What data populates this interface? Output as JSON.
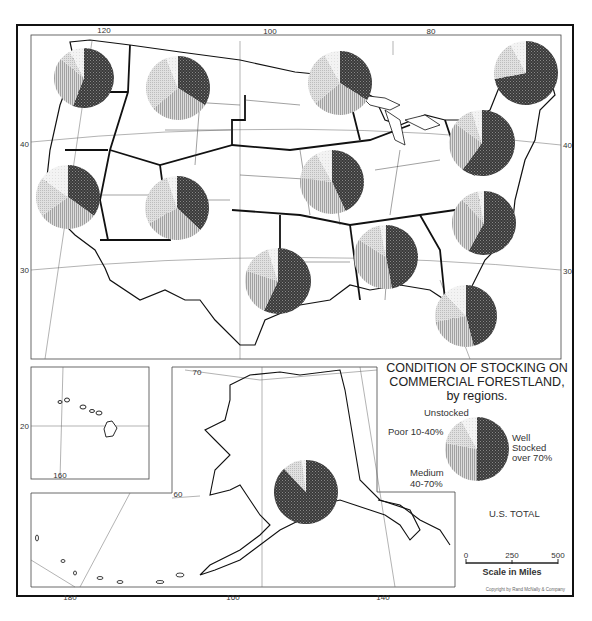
{
  "title": {
    "line1": "CONDITION OF STOCKING ON",
    "line2": "COMMERCIAL FORESTLAND,",
    "line3": "by regions."
  },
  "legend": {
    "unstocked": "Unstocked",
    "poor": "Poor 10-40%",
    "medium_line1": "Medium",
    "medium_line2": "40-70%",
    "well_line1": "Well",
    "well_line2": "Stocked",
    "well_line3": "over 70%",
    "total_label": "U.S. TOTAL"
  },
  "scale": {
    "label": "Scale in Miles",
    "ticks": [
      "0",
      "250",
      "500"
    ]
  },
  "copyright": "Copyright by Rand McNally & Company",
  "graticule": {
    "top_longitudes": [
      "120",
      "100",
      "80"
    ],
    "left_latitudes": [
      "40",
      "30"
    ],
    "right_latitudes": [
      "40",
      "30"
    ],
    "hawaii_lat": "20",
    "hawaii_lon": "160",
    "alaska_lat": [
      "70",
      "60"
    ],
    "bottom_longitudes": [
      "180",
      "160",
      "140"
    ]
  },
  "chart_data": {
    "type": "pie",
    "title": "Condition of Stocking on Commercial Forestland, by regions",
    "categories": [
      "Well Stocked over 70%",
      "Medium 40-70%",
      "Poor 10-40%",
      "Unstocked"
    ],
    "patterns": {
      "Well Stocked over 70%": "dark crosshatch",
      "Medium 40-70%": "vertical lines",
      "Poor 10-40%": "fine grid",
      "Unstocked": "light dots"
    },
    "regions": [
      {
        "name": "Pacific Northwest",
        "values": [
          56,
          30,
          6,
          8
        ]
      },
      {
        "name": "Northern Rocky Mountain",
        "values": [
          34,
          30,
          30,
          6
        ]
      },
      {
        "name": "Lake States",
        "values": [
          34,
          30,
          28,
          8
        ]
      },
      {
        "name": "New England",
        "values": [
          72,
          0,
          20,
          8
        ]
      },
      {
        "name": "Middle Atlantic",
        "values": [
          60,
          25,
          10,
          5
        ]
      },
      {
        "name": "California",
        "values": [
          35,
          30,
          20,
          15
        ]
      },
      {
        "name": "Southern Rocky Mountain",
        "values": [
          37,
          30,
          28,
          5
        ]
      },
      {
        "name": "Central",
        "values": [
          43,
          34,
          15,
          8
        ]
      },
      {
        "name": "West Gulf",
        "values": [
          57,
          23,
          15,
          5
        ]
      },
      {
        "name": "Central South",
        "values": [
          47,
          37,
          13,
          3
        ]
      },
      {
        "name": "South Atlantic",
        "values": [
          58,
          30,
          9,
          3
        ]
      },
      {
        "name": "Southeast",
        "values": [
          46,
          26,
          16,
          12
        ]
      },
      {
        "name": "Alaska",
        "values": [
          88,
          0,
          10,
          2
        ]
      },
      {
        "name": "U.S. Total",
        "values": [
          50,
          28,
          14,
          8
        ]
      }
    ]
  }
}
